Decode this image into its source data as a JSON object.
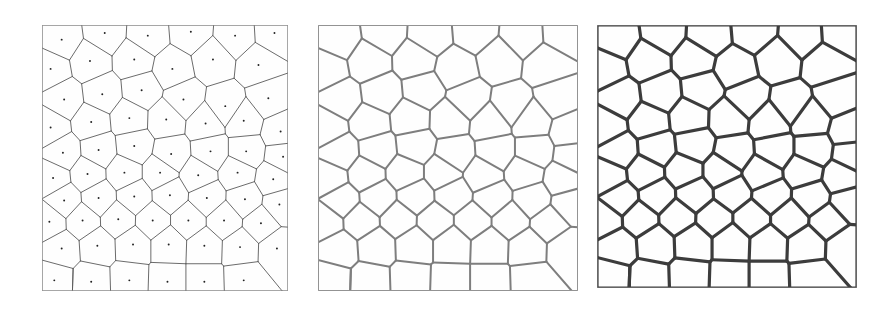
{
  "figure": {
    "background_color": "#ffffff",
    "width": 891,
    "height": 309
  },
  "panels": [
    {
      "id": "panel-left",
      "label": "Voronoi diagram with seed points",
      "x": 42,
      "y": 25,
      "width": 246,
      "height": 266,
      "show_seeds": true,
      "line_color": "#5a5a5a",
      "line_width": 0.9,
      "border_color": "#9a9a9a",
      "border_width": 1,
      "fill_color": "#fefefe",
      "seed_dot_radius": 1.3,
      "seed_dot_color": "#222222"
    },
    {
      "id": "panel-middle",
      "label": "Voronoi diagram, medium line weight",
      "x": 318,
      "y": 25,
      "width": 260,
      "height": 266,
      "show_seeds": false,
      "line_color": "#7e7e7e",
      "line_width": 2.0,
      "border_color": "#a8a8a8",
      "border_width": 1,
      "fill_color": "#fefefe",
      "seed_dot_radius": 0,
      "seed_dot_color": "#222222"
    },
    {
      "id": "panel-right",
      "label": "Voronoi diagram, heavy line weight",
      "x": 597,
      "y": 25,
      "width": 260,
      "height": 263,
      "show_seeds": false,
      "line_color": "#3c3c3c",
      "line_width": 3.2,
      "border_color": "#8f8f8f",
      "border_width": 1,
      "fill_color": "#fefefe",
      "seed_dot_radius": 0,
      "seed_dot_color": "#222222"
    }
  ],
  "chart_data": {
    "type": "scatter",
    "xlabel": "",
    "ylabel": "",
    "xlim": [
      0,
      100
    ],
    "ylim": [
      0,
      100
    ],
    "grid": false,
    "legend": "none",
    "note": "Coordinates are normalized to a 0-100 unit square matching each panel's interior. The same seed set generates all three panels.",
    "seed_count": 66,
    "seeds": [
      [
        8.0,
        5.5
      ],
      [
        25.5,
        3.0
      ],
      [
        43.0,
        4.0
      ],
      [
        60.5,
        2.5
      ],
      [
        78.5,
        4.0
      ],
      [
        94.5,
        3.0
      ],
      [
        3.5,
        16.5
      ],
      [
        19.5,
        13.5
      ],
      [
        37.5,
        13.0
      ],
      [
        53.0,
        16.5
      ],
      [
        69.5,
        13.0
      ],
      [
        88.0,
        15.0
      ],
      [
        9.0,
        28.0
      ],
      [
        24.5,
        26.0
      ],
      [
        40.5,
        24.5
      ],
      [
        57.5,
        28.0
      ],
      [
        74.5,
        30.5
      ],
      [
        92.0,
        27.5
      ],
      [
        3.5,
        38.5
      ],
      [
        20.0,
        36.5
      ],
      [
        35.5,
        35.0
      ],
      [
        50.5,
        35.5
      ],
      [
        66.5,
        37.0
      ],
      [
        82.0,
        36.0
      ],
      [
        97.0,
        40.0
      ],
      [
        8.5,
        48.0
      ],
      [
        23.0,
        47.0
      ],
      [
        37.5,
        45.5
      ],
      [
        52.5,
        48.5
      ],
      [
        68.5,
        47.5
      ],
      [
        83.0,
        47.5
      ],
      [
        98.0,
        49.5
      ],
      [
        4.5,
        57.5
      ],
      [
        18.5,
        56.0
      ],
      [
        33.5,
        55.5
      ],
      [
        48.0,
        55.5
      ],
      [
        63.5,
        56.5
      ],
      [
        79.5,
        55.5
      ],
      [
        94.0,
        58.0
      ],
      [
        9.0,
        66.0
      ],
      [
        23.0,
        65.0
      ],
      [
        37.5,
        64.5
      ],
      [
        52.0,
        64.0
      ],
      [
        67.0,
        65.0
      ],
      [
        82.5,
        65.5
      ],
      [
        96.5,
        67.5
      ],
      [
        3.0,
        74.0
      ],
      [
        16.5,
        73.5
      ],
      [
        31.0,
        73.0
      ],
      [
        45.0,
        73.5
      ],
      [
        59.5,
        73.5
      ],
      [
        74.0,
        73.5
      ],
      [
        89.0,
        74.5
      ],
      [
        8.0,
        84.0
      ],
      [
        22.5,
        83.0
      ],
      [
        37.0,
        82.5
      ],
      [
        51.5,
        82.5
      ],
      [
        66.0,
        83.0
      ],
      [
        80.5,
        83.5
      ],
      [
        95.5,
        84.0
      ],
      [
        5.0,
        96.0
      ],
      [
        20.0,
        96.5
      ],
      [
        35.5,
        96.0
      ],
      [
        51.0,
        96.5
      ],
      [
        66.0,
        96.5
      ],
      [
        82.0,
        96.0
      ]
    ],
    "cell_count": 66,
    "panel_line_weights": [
      0.9,
      2.0,
      3.2
    ],
    "panel_line_colors": [
      "#5a5a5a",
      "#7e7e7e",
      "#3c3c3c"
    ]
  }
}
